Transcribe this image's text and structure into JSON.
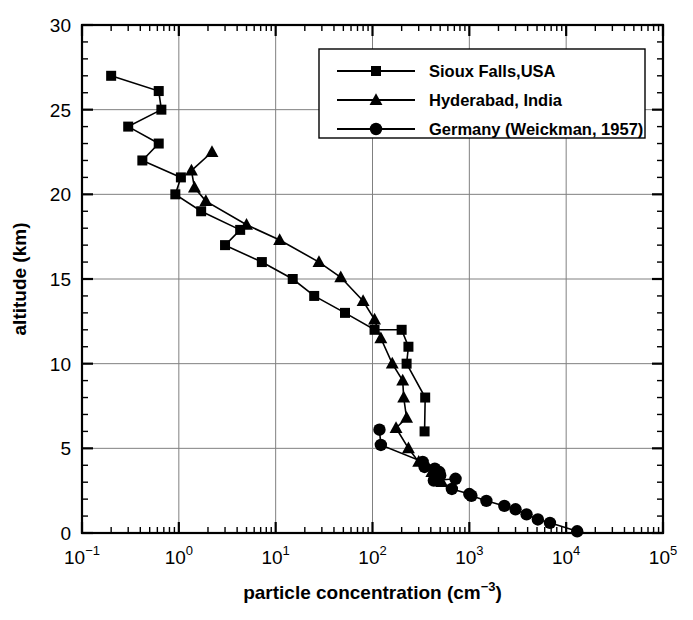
{
  "chart_data": {
    "type": "line",
    "title": "",
    "xlabel": "particle concentration (cm-3)",
    "xlabel_base": "particle concentration (cm",
    "xlabel_exp": "−3",
    "xlabel_tail": ")",
    "ylabel": "altitude (km)",
    "xscale": "log",
    "yscale": "linear",
    "xlim": [
      0.1,
      100000
    ],
    "ylim": [
      0,
      30
    ],
    "xticks": [
      0.1,
      1,
      10,
      100,
      1000,
      10000,
      100000
    ],
    "xtick_labels": [
      "10-1",
      "100",
      "101",
      "102",
      "103",
      "104",
      "105"
    ],
    "xtick_mantissa": "10",
    "xtick_exponents": [
      "−1",
      "0",
      "1",
      "2",
      "3",
      "4",
      "5"
    ],
    "yticks": [
      0,
      5,
      10,
      15,
      20,
      25,
      30
    ],
    "ytick_labels": [
      "0",
      "5",
      "10",
      "15",
      "20",
      "25",
      "30"
    ],
    "yminor_step": 1,
    "grid": true,
    "grid_color": "#808080",
    "legend_position": "upper right",
    "line_color": "#000000",
    "series": [
      {
        "name": "Sioux Falls,USA",
        "marker": "square",
        "points": [
          [
            0.2,
            27.0
          ],
          [
            0.62,
            26.1
          ],
          [
            0.66,
            25.0
          ],
          [
            0.3,
            24.0
          ],
          [
            0.62,
            23.0
          ],
          [
            0.42,
            22.0
          ],
          [
            1.05,
            21.0
          ],
          [
            0.92,
            20.0
          ],
          [
            1.7,
            19.0
          ],
          [
            4.3,
            17.9
          ],
          [
            3.0,
            17.0
          ],
          [
            7.2,
            16.0
          ],
          [
            15.0,
            15.0
          ],
          [
            25.0,
            14.0
          ],
          [
            52.0,
            13.0
          ],
          [
            105.0,
            12.0
          ],
          [
            200.0,
            12.0
          ],
          [
            235.0,
            11.0
          ],
          [
            225.0,
            10.0
          ],
          [
            350.0,
            8.0
          ],
          [
            345.0,
            6.0
          ]
        ]
      },
      {
        "name": "Hyderabad, India",
        "marker": "triangle",
        "points": [
          [
            2.2,
            22.5
          ],
          [
            1.35,
            21.4
          ],
          [
            1.45,
            20.4
          ],
          [
            1.9,
            19.6
          ],
          [
            5.0,
            18.2
          ],
          [
            11.0,
            17.3
          ],
          [
            28.0,
            16.0
          ],
          [
            47.0,
            15.1
          ],
          [
            80.0,
            13.7
          ],
          [
            105.0,
            12.6
          ],
          [
            122.0,
            11.5
          ],
          [
            160.0,
            10.0
          ],
          [
            205.0,
            9.0
          ],
          [
            210.0,
            8.0
          ],
          [
            225.0,
            6.8
          ],
          [
            175.0,
            6.2
          ],
          [
            235.0,
            5.0
          ],
          [
            300.0,
            4.2
          ],
          [
            410.0,
            3.6
          ],
          [
            520.0,
            3.0
          ]
        ]
      },
      {
        "name": "Germany (Weickman, 1957)",
        "marker": "circle",
        "points": [
          [
            118.0,
            6.1
          ],
          [
            122.0,
            5.2
          ],
          [
            330.0,
            4.2
          ],
          [
            345.0,
            3.9
          ],
          [
            440.0,
            3.8
          ],
          [
            490.0,
            3.6
          ],
          [
            500.0,
            3.4
          ],
          [
            430.0,
            3.1
          ],
          [
            720.0,
            3.2
          ],
          [
            660.0,
            2.6
          ],
          [
            1000.0,
            2.3
          ],
          [
            1050.0,
            2.2
          ],
          [
            1500.0,
            1.9
          ],
          [
            2300.0,
            1.6
          ],
          [
            3000.0,
            1.4
          ],
          [
            3900.0,
            1.1
          ],
          [
            5100.0,
            0.8
          ],
          [
            6800.0,
            0.6
          ],
          [
            13000.0,
            0.1
          ]
        ]
      }
    ]
  },
  "legend": {
    "entries": [
      {
        "label": "Sioux Falls,USA",
        "marker": "square"
      },
      {
        "label": "Hyderabad, India",
        "marker": "triangle"
      },
      {
        "label": "Germany (Weickman, 1957)",
        "marker": "circle"
      }
    ]
  }
}
